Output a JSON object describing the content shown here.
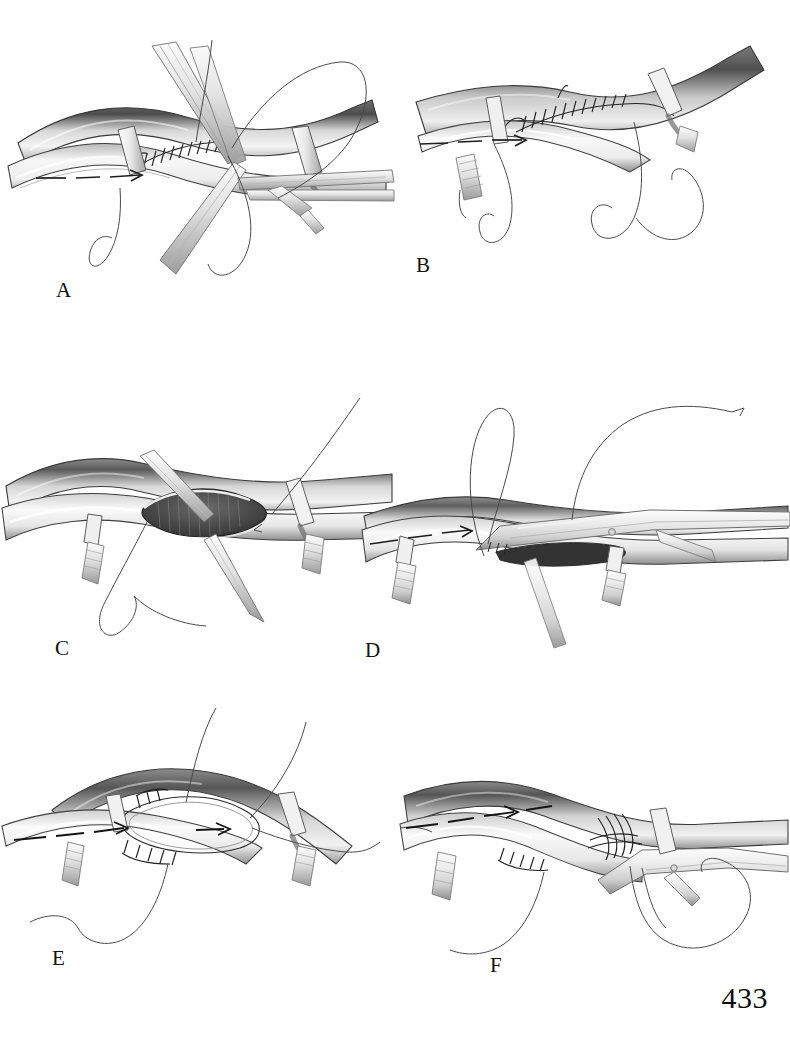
{
  "page": {
    "number": "433",
    "background_color": "#ffffff",
    "ink_color": "#1a1a1a",
    "width": 790,
    "height": 1045
  },
  "figure": {
    "type": "surgical-illustration",
    "style": "grayscale pen-and-ink airbrush medical illustration",
    "panel_count": 6,
    "palette": {
      "vessel_light": "#f2f2f2",
      "vessel_mid": "#9a9a9a",
      "vessel_dark": "#4a4a4a",
      "lumen_dark": "#3a3a3a",
      "instrument_light": "#ededed",
      "instrument_shadow": "#8e8e8e",
      "suture_thread": "#4f4f4f",
      "outline": "#2b2b2b"
    },
    "panels": [
      {
        "id": "a",
        "label": "A",
        "caption_text": "A",
        "description": "Anastomosis with corner stay sutures held by forceps; running suture line partially completed; two vessel loops encircle the host vessel; long suture tails loop below.",
        "elements": [
          "host-vessel",
          "graft-limb",
          "vessel-loop",
          "vessel-loop",
          "forceps",
          "forceps",
          "needle-holder",
          "running-suture",
          "suture-loop",
          "flow-arrow"
        ]
      },
      {
        "id": "b",
        "label": "B",
        "caption_text": "B",
        "description": "Completed running anastomosis viewed from above; continuous suture line along the graft heel; vessel loops at both ends; free suture ends loop downward.",
        "elements": [
          "host-vessel",
          "graft-limb",
          "vessel-loop",
          "vessel-loop",
          "bulldog-clamp",
          "running-suture",
          "suture-loop",
          "suture-loop",
          "flow-arrow"
        ]
      },
      {
        "id": "c",
        "label": "C",
        "caption_text": "C",
        "description": "Open arteriotomy with dark striated lumen exposed; edges retracted by fine forceps at the apex and base; suture entering the right corner; vessel loop with tourniquet clip below.",
        "elements": [
          "host-vessel",
          "arteriotomy-lumen",
          "forceps",
          "forceps",
          "vessel-loop",
          "tourniquet-clip",
          "suture-thread",
          "suture-loop"
        ]
      },
      {
        "id": "d",
        "label": "D",
        "caption_text": "D",
        "description": "Needle holder clamped across the anastomosis line; large suture loop rising above; two vessel loops with clips on either side; needle and thread drawn through.",
        "elements": [
          "host-vessel",
          "graft-limb",
          "needle-holder",
          "suture-loop",
          "needle",
          "vessel-loop",
          "vessel-loop",
          "tourniquet-clip",
          "flow-arrow"
        ]
      },
      {
        "id": "e",
        "label": "E",
        "caption_text": "E",
        "description": "Graft sewn to the host vessel showing heel and toe of the anastomosis; interrupted stitches along the lower edge; directional flow arrows within the vessel; suture tails above and below.",
        "elements": [
          "host-vessel",
          "graft-limb",
          "anastomosis-seam",
          "interrupted-suture",
          "vessel-loop",
          "vessel-loop",
          "tourniquet-clip",
          "suture-loop",
          "flow-arrow",
          "flow-arrow"
        ]
      },
      {
        "id": "f",
        "label": "F",
        "caption_text": "F",
        "description": "Final anastomosis with running suture drawn snug; clamp applied to the right limb; suture loops trailing below; flow arrow in the proximal vessel.",
        "elements": [
          "host-vessel",
          "graft-limb",
          "running-suture",
          "clamp",
          "vessel-loop",
          "tourniquet-clip",
          "suture-loop",
          "suture-loop",
          "flow-arrow"
        ]
      }
    ]
  }
}
